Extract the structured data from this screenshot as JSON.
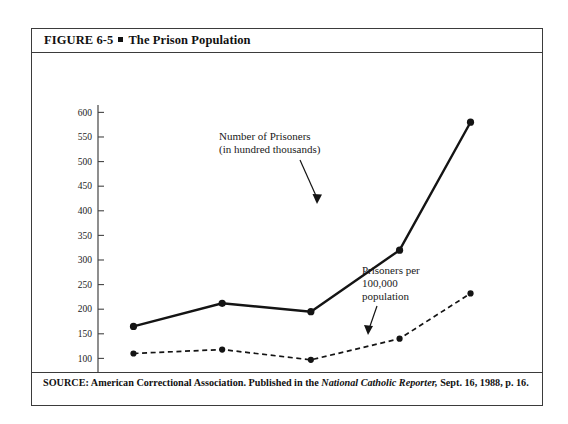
{
  "figure": {
    "title_prefix": "FIGURE 6-5",
    "title_text": "The Prison Population",
    "bullet_icon": "square-bullet-icon"
  },
  "source": {
    "lead": "SOURCE:",
    "text_before_italic": " American Correctional Association. Published in the ",
    "italic_title": "National Catholic Reporter,",
    "text_after_italic": " Sept. 16, 1988, p. 16."
  },
  "chart_data": {
    "type": "line",
    "title": "The Prison Population",
    "xlabel": "",
    "ylabel": "",
    "x": [
      1950,
      1960,
      1970,
      1980,
      1988
    ],
    "categories": [
      "1950",
      "1960",
      "1970",
      "1980",
      "1988"
    ],
    "xlim": [
      1946,
      1992
    ],
    "ylim": [
      50,
      615
    ],
    "yticks": [
      50,
      100,
      150,
      200,
      250,
      300,
      350,
      400,
      450,
      500,
      550,
      600
    ],
    "ytick_labels": [
      "50",
      "100",
      "150",
      "200",
      "250",
      "300",
      "350",
      "400",
      "450",
      "500",
      "550",
      "600"
    ],
    "grid": false,
    "legend": "annotations",
    "series": [
      {
        "name": "Number of Prisoners (in hundred thousands)",
        "style": "solid",
        "marker": "filled-circle",
        "values": [
          165,
          212,
          195,
          320,
          580
        ]
      },
      {
        "name": "Prisoners per 100,000 population",
        "style": "dashed",
        "marker": "filled-circle",
        "values": [
          110,
          118,
          97,
          140,
          232
        ]
      }
    ],
    "annotations": [
      {
        "id": "annotation-prisoners-count",
        "lines": [
          "Number of Prisoners",
          "(in hundred thousands)"
        ],
        "arrow": "down-right-arrow"
      },
      {
        "id": "annotation-prisoners-rate",
        "lines": [
          "Prisoners per",
          "100,000",
          "population"
        ],
        "arrow": "down-arrow"
      }
    ]
  }
}
